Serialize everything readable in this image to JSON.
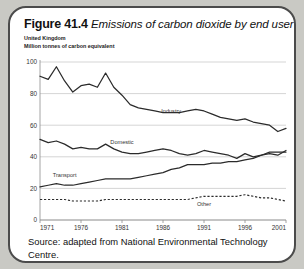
{
  "figure": {
    "number_label": "Figure 41.4",
    "caption": "Emissions of carbon dioxide by end user",
    "subtitle_line1": "United Kingdom",
    "subtitle_line2": "Million tonnes of carbon equivalent",
    "source": "Source: adapted from National Environmental Technology Centre."
  },
  "chart_data": {
    "type": "line",
    "title": "Emissions of carbon dioxide by end user",
    "subtitle": "United Kingdom",
    "xlabel": "",
    "ylabel": "Million tonnes of carbon equivalent",
    "xlim": [
      1971,
      2001
    ],
    "ylim": [
      0,
      100
    ],
    "ytick_labels": [
      "0",
      "20",
      "40",
      "60",
      "80",
      "100"
    ],
    "yticks": [
      0,
      20,
      40,
      60,
      80,
      100
    ],
    "xtick_labels": [
      "1971",
      "1976",
      "1981",
      "1986",
      "1991",
      "1996",
      "2001"
    ],
    "xticks": [
      1971,
      1976,
      1981,
      1986,
      1991,
      1996,
      2001
    ],
    "grid": true,
    "legend": "inline-labels",
    "x": [
      1971,
      1972,
      1973,
      1974,
      1975,
      1976,
      1977,
      1978,
      1979,
      1980,
      1981,
      1982,
      1983,
      1984,
      1985,
      1986,
      1987,
      1988,
      1989,
      1990,
      1991,
      1992,
      1993,
      1994,
      1995,
      1996,
      1997,
      1998,
      1999,
      2000,
      2001
    ],
    "series": [
      {
        "name": "Industry",
        "style": "solid",
        "color": "#2b2b2b",
        "label_x": 1987,
        "label_y": 68,
        "values": [
          91,
          89,
          97,
          88,
          81,
          85,
          86,
          84,
          93,
          84,
          79,
          73,
          71,
          70,
          69,
          68,
          68,
          68,
          69,
          70,
          69,
          67,
          65,
          64,
          63,
          64,
          62,
          61,
          60,
          56,
          58
        ]
      },
      {
        "name": "Domestic",
        "style": "solid",
        "color": "#2b2b2b",
        "label_x": 1981,
        "label_y": 48,
        "values": [
          51,
          49,
          50,
          48,
          45,
          46,
          45,
          45,
          48,
          45,
          43,
          42,
          42,
          43,
          44,
          45,
          44,
          42,
          41,
          42,
          44,
          43,
          42,
          41,
          39,
          42,
          40,
          41,
          42,
          41,
          44
        ]
      },
      {
        "name": "Transport",
        "style": "solid",
        "color": "#2b2b2b",
        "label_x": 1974,
        "label_y": 27,
        "values": [
          21,
          22,
          23,
          22,
          22,
          23,
          24,
          25,
          26,
          26,
          26,
          26,
          27,
          28,
          29,
          30,
          32,
          33,
          35,
          35,
          35,
          36,
          36,
          37,
          37,
          38,
          39,
          41,
          43,
          43,
          43
        ]
      },
      {
        "name": "Other",
        "style": "dashed",
        "color": "#2b2b2b",
        "label_x": 1991,
        "label_y": 9,
        "values": [
          13,
          13,
          13,
          13,
          12,
          12,
          12,
          12,
          13,
          13,
          13,
          13,
          13,
          13,
          13,
          13,
          13,
          13,
          13,
          14,
          15,
          15,
          15,
          15,
          15,
          16,
          15,
          14,
          14,
          13,
          12
        ]
      }
    ]
  }
}
